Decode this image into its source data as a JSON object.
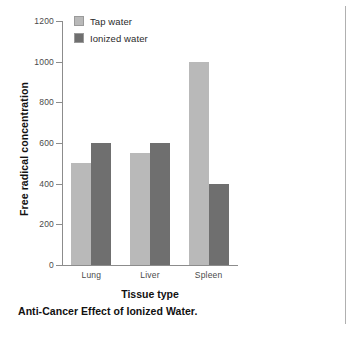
{
  "figure": {
    "caption": "Anti-Cancer Effect of Ionized Water."
  },
  "colors": {
    "tap_water": "#b9b9b9",
    "ionized_water": "#6f6f6f",
    "axis": "#8c8c8c",
    "text": "#111111",
    "tick_text": "#4a4a4a",
    "page_rule": "#b0b0b0",
    "background": "#ffffff"
  },
  "legend": {
    "position": "top-left-inside",
    "entries": [
      {
        "label": "Tap water",
        "color": "#b9b9b9"
      },
      {
        "label": "Ionized water",
        "color": "#6f6f6f"
      }
    ]
  },
  "chart_data": {
    "type": "bar",
    "title": "",
    "subtitle": "",
    "caption": "Anti-Cancer Effect of Ionized Water.",
    "xlabel": "Tissue type",
    "ylabel": "Free radical concentration",
    "categories": [
      "Lung",
      "Liver",
      "Spleen"
    ],
    "series": [
      {
        "name": "Tap water",
        "color": "#b9b9b9",
        "values": [
          500,
          550,
          1000
        ]
      },
      {
        "name": "Ionized water",
        "color": "#6f6f6f",
        "values": [
          600,
          600,
          400
        ]
      }
    ],
    "ylim": [
      0,
      1200
    ],
    "yticks": [
      0,
      200,
      400,
      600,
      800,
      1000,
      1200
    ],
    "ytick_labels": [
      "0",
      "200",
      "400",
      "600",
      "800",
      "1000",
      "1200"
    ],
    "grid": false,
    "legend_position": "upper left (inside axes)",
    "grouped": true,
    "bar_gap": "none within group"
  }
}
